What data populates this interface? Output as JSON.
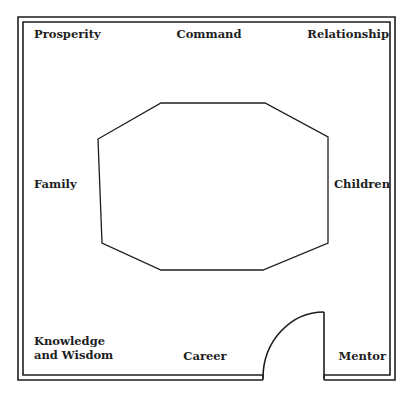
{
  "diagram": {
    "type": "feng-shui-bagua-floorplan",
    "stroke_color": "#1e1e1e",
    "background_color": "#ffffff",
    "areas": {
      "prosperity": "Prosperity",
      "command": "Command",
      "relationship": "Relationship",
      "family": "Family",
      "children": "Children",
      "knowledge_line1": "Knowledge",
      "knowledge_line2": "and Wisdom",
      "career": "Career",
      "mentor": "Mentor"
    },
    "elements": {
      "outer_wall": "double-line rectangular wall",
      "center_shape": "octagon",
      "entrance": "door with swing arc at bottom right"
    }
  }
}
